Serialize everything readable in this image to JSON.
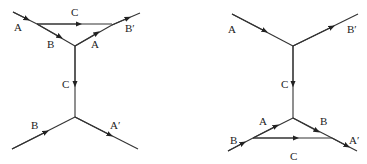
{
  "diagrams": [
    {
      "name": "left-diagram",
      "labels": {
        "a_in": "A",
        "c_top": "C",
        "b_loop": "B",
        "a_loop": "A",
        "b_prime_out": "B′",
        "c_vertical": "C",
        "b_in": "B",
        "a_prime_out": "A′"
      }
    },
    {
      "name": "right-diagram",
      "labels": {
        "a_in": "A",
        "b_prime_out": "B′",
        "c_vertical": "C",
        "a_loop": "A",
        "b_loop": "B",
        "b_in": "B",
        "c_bottom": "C",
        "a_prime_out": "A′"
      }
    }
  ],
  "colors": {
    "line": "#333333",
    "text": "#222222",
    "background": "#ffffff"
  }
}
